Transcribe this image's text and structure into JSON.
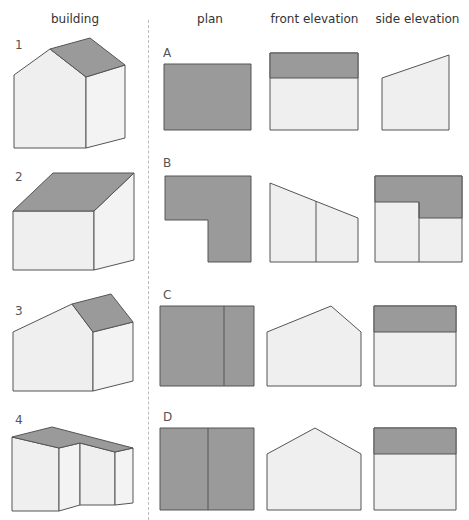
{
  "headers": {
    "building": "building",
    "plan": "plan",
    "front_elevation": "front elevation",
    "side_elevation": "side elevation"
  },
  "buildings": [
    {
      "label": "1"
    },
    {
      "label": "2"
    },
    {
      "label": "3"
    },
    {
      "label": "4"
    }
  ],
  "views": [
    {
      "label": "A"
    },
    {
      "label": "B"
    },
    {
      "label": "C"
    },
    {
      "label": "D"
    }
  ],
  "colors": {
    "roof": "#9a9a9a",
    "wall": "#efefef",
    "stroke": "#555555",
    "divider": "#bbbbbb"
  }
}
